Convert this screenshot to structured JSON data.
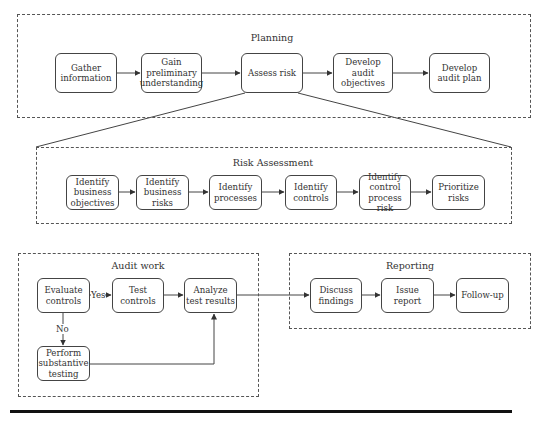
{
  "planning": {
    "title": "Planning",
    "nodes": [
      "Gather information",
      "Gain preliminary understanding",
      "Assess risk",
      "Develop audit objectives",
      "Develop audit plan"
    ]
  },
  "risk_assessment": {
    "title": "Risk Assessment",
    "nodes": [
      "Identify business objectives",
      "Identify business risks",
      "Identify processes",
      "Identify controls",
      "Identify control process risk",
      "Prioritize risks"
    ]
  },
  "audit_work": {
    "title": "Audit work",
    "nodes": {
      "evaluate": "Evaluate controls",
      "test": "Test controls",
      "analyze": "Analyze test results",
      "substantive": "Perform substantive testing"
    },
    "labels": {
      "yes": "Yes",
      "no": "No"
    }
  },
  "reporting": {
    "title": "Reporting",
    "nodes": [
      "Discuss findings",
      "Issue report",
      "Follow-up"
    ]
  },
  "colors": {
    "line": "#444444",
    "text": "#333333",
    "rule": "#111111"
  }
}
